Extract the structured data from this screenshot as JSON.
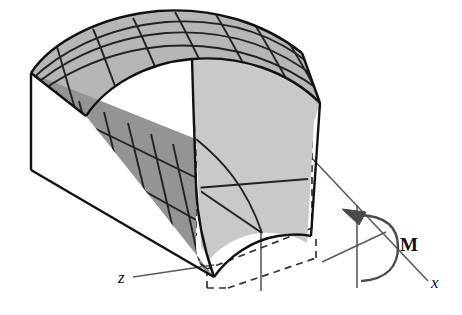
{
  "figure": {
    "background_color": "#ffffff",
    "width": 462,
    "height": 315
  },
  "colors": {
    "outline": "#1a1a1a",
    "top_face": "#b6b6b6",
    "side_face": "#949494",
    "end_face": "#c9c9c9",
    "grid_line": "#2a2a2a",
    "dashed_line": "#3a3a3a",
    "axis_line": "#5a5a5a",
    "moment_arrow": "#4a4a4a",
    "label_text": "#111111"
  },
  "axes": [
    {
      "id": "y-axis",
      "label": "y",
      "style": "italic",
      "orientation": "vertical",
      "label_x": 258,
      "label_y": 40
    },
    {
      "id": "z-axis",
      "label": "z",
      "style": "italic",
      "orientation": "diagonal-lower-left",
      "label_x": 120,
      "label_y": 281
    },
    {
      "id": "x-axis",
      "label": "x",
      "style": "italic",
      "orientation": "diagonal-lower-right",
      "label_x": 434,
      "label_y": 285
    }
  ],
  "moment": {
    "label": "M",
    "style": "bold",
    "label_x": 404,
    "label_y": 243,
    "arrow_direction": "counterclockwise-about-x",
    "arrowhead_position": "top-left"
  },
  "body": {
    "description": "Deformed prismatic bar with curved grid on top and side faces",
    "grid": {
      "top_face_rows": 4,
      "top_face_cols": 7,
      "side_face_rows": 4,
      "side_face_cols": 7,
      "end_face_rows": 2,
      "end_face_cols": 2
    },
    "undeformed_outline": "dashed",
    "deformed_outline": "solid"
  }
}
